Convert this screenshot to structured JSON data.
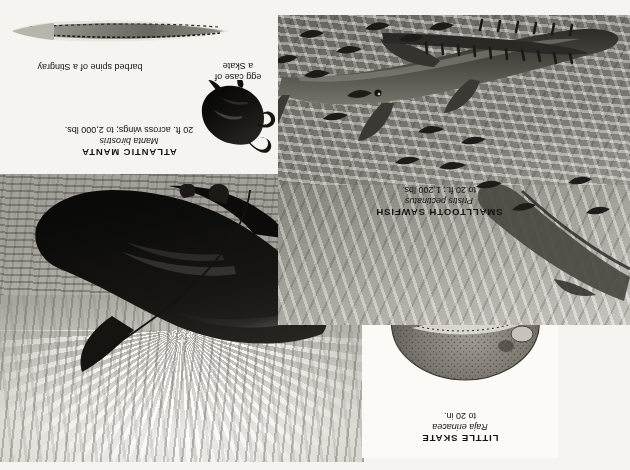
{
  "plate": {
    "background_color": "#f6f4f0",
    "orientation": "upside-down",
    "ink_color": "#121212"
  },
  "specimens": [
    {
      "id": "little-skate",
      "common_name": "LITTLE SKATE",
      "scientific_name": "Raja erinacea",
      "size": "to 20 in.",
      "panel": "centre-white"
    },
    {
      "id": "smalltooth-sawfish",
      "common_name": "SMALLTOOTH SAWFISH",
      "scientific_name": "Pristis pectinatus",
      "size": "to 20 ft.; 1,200 lbs.",
      "panel": "lower-left"
    },
    {
      "id": "atlantic-manta",
      "common_name": "ATLANTIC MANTA",
      "scientific_name": "Manta birostris",
      "size": "20 ft. across wings; to 2,000 lbs.",
      "panel": "upper-right"
    }
  ],
  "annotations": {
    "stingray_spine": "barbed spine of a Stingray",
    "egg_case_line1": "egg case of",
    "egg_case_line2": "a Skate"
  },
  "icons": {
    "manta": "manta-ray-icon",
    "skate": "little-skate-icon",
    "sawfish": "sawfish-icon",
    "spine": "barbed-spine-icon",
    "eggcase": "egg-case-icon",
    "diver": "diver-icon"
  }
}
